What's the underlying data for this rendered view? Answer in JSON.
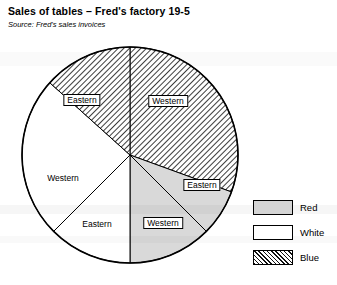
{
  "header": {
    "title": "Sales of tables – Fred's factory 19-5",
    "subtitle": "Source: Fred's sales invoices"
  },
  "legend": {
    "items": [
      {
        "label": "Red",
        "swatch": "light-gray-fill",
        "color": "#d4d4d4"
      },
      {
        "label": "White",
        "swatch": "white-fill",
        "color": "#ffffff"
      },
      {
        "label": "Blue",
        "swatch": "diagonal-hatch",
        "color": "#111111"
      }
    ]
  },
  "chart_data": {
    "type": "pie",
    "title": "Sales of tables – Fred's factory 19-5",
    "subtitle": "Source: Fred's sales invoices",
    "xlabel": "",
    "ylabel": "",
    "legend_position": "right",
    "grid": false,
    "center": {
      "cx": 130,
      "cy": 155,
      "r": 108
    },
    "categories": [
      "Blue / Western",
      "Red / Eastern",
      "Red / Western",
      "White / Eastern",
      "White / Western",
      "Blue / Eastern"
    ],
    "values": [
      30.5,
      7.0,
      12.5,
      12.5,
      24.0,
      13.5
    ],
    "slices": [
      {
        "region": "Western",
        "colour": "Blue",
        "fill": "hatch",
        "percent": 30.5,
        "start_deg": 0,
        "end_deg": 110,
        "label": "Western",
        "label_boxed": true,
        "label_x": 168,
        "label_y": 101
      },
      {
        "region": "Eastern",
        "colour": "Red",
        "fill": "gray",
        "percent": 7.0,
        "start_deg": 110,
        "end_deg": 135,
        "label": "Eastern",
        "label_boxed": true,
        "label_x": 202,
        "label_y": 185
      },
      {
        "region": "Western",
        "colour": "Red",
        "fill": "gray",
        "percent": 12.5,
        "start_deg": 135,
        "end_deg": 180,
        "label": "Western",
        "label_boxed": true,
        "label_x": 163,
        "label_y": 223
      },
      {
        "region": "Eastern",
        "colour": "White",
        "fill": "white",
        "percent": 12.5,
        "start_deg": 180,
        "end_deg": 225,
        "label": "Eastern",
        "label_boxed": false,
        "label_x": 97,
        "label_y": 224
      },
      {
        "region": "Western",
        "colour": "White",
        "fill": "white",
        "percent": 24.0,
        "start_deg": 225,
        "end_deg": 312,
        "label": "Western",
        "label_boxed": false,
        "label_x": 63,
        "label_y": 178
      },
      {
        "region": "Eastern",
        "colour": "Blue",
        "fill": "hatch",
        "percent": 13.5,
        "start_deg": 312,
        "end_deg": 360,
        "label": "Eastern",
        "label_boxed": true,
        "label_x": 82,
        "label_y": 100
      }
    ]
  }
}
